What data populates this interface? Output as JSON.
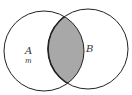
{
  "diagram": {
    "type": "venn",
    "sets": [
      {
        "id": "A",
        "label": "A",
        "sublabel": "m"
      },
      {
        "id": "B",
        "label": "B"
      }
    ],
    "shaded_region": "A∩B",
    "colors": {
      "stroke": "#222222",
      "shade": "#a8a8a8",
      "background": "#ffffff"
    }
  }
}
